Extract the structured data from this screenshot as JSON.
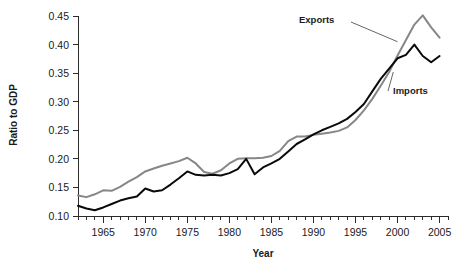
{
  "chart_data": {
    "type": "line",
    "title": "",
    "xlabel": "Year",
    "ylabel": "Ratio to GDP",
    "xlim": [
      1962,
      2006
    ],
    "ylim": [
      0.1,
      0.45
    ],
    "grid": false,
    "legend_position": "inline-annotations",
    "x_tick_labels": [
      "1965",
      "1970",
      "1975",
      "1980",
      "1985",
      "1990",
      "1995",
      "2000",
      "2005"
    ],
    "x_tick_values": [
      1965,
      1970,
      1975,
      1980,
      1985,
      1990,
      1995,
      2000,
      2005
    ],
    "x_minor_tick_interval": 1,
    "y_tick_labels": [
      "0.10",
      "0.15",
      "0.20",
      "0.25",
      "0.30",
      "0.35",
      "0.40",
      "0.45"
    ],
    "y_tick_values": [
      0.1,
      0.15,
      0.2,
      0.25,
      0.3,
      0.35,
      0.4,
      0.45
    ],
    "annotations": [
      {
        "text": "Exports",
        "series": "Exports"
      },
      {
        "text": "Imports",
        "series": "Imports"
      }
    ],
    "x": [
      1962,
      1963,
      1964,
      1965,
      1966,
      1967,
      1968,
      1969,
      1970,
      1971,
      1972,
      1973,
      1974,
      1975,
      1976,
      1977,
      1978,
      1979,
      1980,
      1981,
      1982,
      1983,
      1984,
      1985,
      1986,
      1987,
      1988,
      1989,
      1990,
      1991,
      1992,
      1993,
      1994,
      1995,
      1996,
      1997,
      1998,
      1999,
      2000,
      2001,
      2002,
      2003,
      2004,
      2005
    ],
    "series": [
      {
        "name": "Exports",
        "color": "#878787",
        "values": [
          0.136,
          0.133,
          0.138,
          0.145,
          0.144,
          0.151,
          0.16,
          0.168,
          0.178,
          0.183,
          0.188,
          0.192,
          0.196,
          0.202,
          0.192,
          0.177,
          0.174,
          0.18,
          0.192,
          0.2,
          0.201,
          0.201,
          0.202,
          0.205,
          0.214,
          0.231,
          0.239,
          0.239,
          0.242,
          0.244,
          0.246,
          0.249,
          0.255,
          0.268,
          0.285,
          0.305,
          0.328,
          0.352,
          0.381,
          0.408,
          0.435,
          0.451,
          0.43,
          0.412
        ]
      },
      {
        "name": "Imports",
        "color": "#0a0a0a",
        "values": [
          0.118,
          0.113,
          0.11,
          0.115,
          0.121,
          0.127,
          0.131,
          0.134,
          0.148,
          0.143,
          0.145,
          0.155,
          0.166,
          0.178,
          0.172,
          0.171,
          0.172,
          0.171,
          0.175,
          0.182,
          0.2,
          0.173,
          0.185,
          0.192,
          0.2,
          0.213,
          0.226,
          0.234,
          0.243,
          0.25,
          0.256,
          0.262,
          0.27,
          0.282,
          0.296,
          0.318,
          0.34,
          0.358,
          0.376,
          0.382,
          0.4,
          0.38,
          0.369,
          0.38
        ]
      }
    ]
  },
  "labels": {
    "y_axis_title": "Ratio to GDP",
    "x_axis_title": "Year",
    "exports_annotation": "Exports",
    "imports_annotation": "Imports"
  },
  "colors": {
    "exports": "#878787",
    "imports": "#0a0a0a",
    "axis": "#2b2b2b",
    "text": "#1a1a1a",
    "background": "#ffffff"
  }
}
